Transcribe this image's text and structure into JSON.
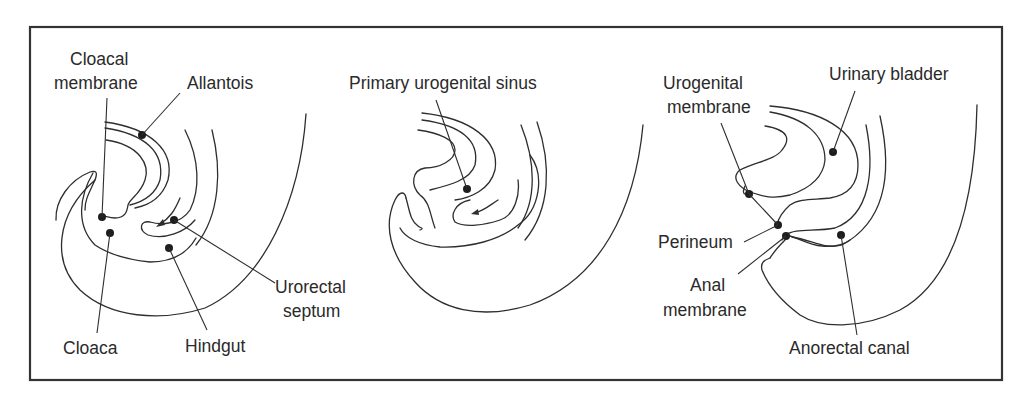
{
  "figure": {
    "colors": {
      "line": "#2e2e2e",
      "frame": "#333333",
      "dot": "#1e1e1e",
      "background": "#ffffff"
    }
  },
  "panels": [
    {
      "id": "panel-1",
      "stage": "early",
      "labels": {
        "cloacal_membrane_line1": "Cloacal",
        "cloacal_membrane_line2": "membrane",
        "allantois": "Allantois",
        "urorectal_septum_line1": "Urorectal",
        "urorectal_septum_line2": "septum",
        "cloaca": "Cloaca",
        "hindgut": "Hindgut"
      }
    },
    {
      "id": "panel-2",
      "stage": "intermediate",
      "labels": {
        "primary_urogenital_sinus": "Primary urogenital sinus"
      }
    },
    {
      "id": "panel-3",
      "stage": "late",
      "labels": {
        "urogenital_membrane_line1": "Urogenital",
        "urogenital_membrane_line2": "membrane",
        "urinary_bladder": "Urinary bladder",
        "perineum": "Perineum",
        "anal_membrane_line1": "Anal",
        "anal_membrane_line2": "membrane",
        "anorectal_canal": "Anorectal canal"
      }
    }
  ]
}
